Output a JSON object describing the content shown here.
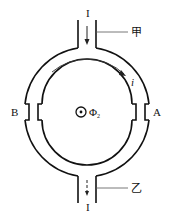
{
  "diagram": {
    "type": "physics-circuit-ring",
    "labels": {
      "inlet_current": "I",
      "outlet_current": "I",
      "tube_top": "甲",
      "tube_bottom": "乙",
      "ring_current": "i",
      "left_point": "B",
      "right_point": "A",
      "flux_symbol": "Φ",
      "flux_subscript": "2"
    },
    "colors": {
      "stroke": "#111111",
      "arrow": "#222222",
      "leader_line": "#555555",
      "background": "#ffffff"
    }
  }
}
